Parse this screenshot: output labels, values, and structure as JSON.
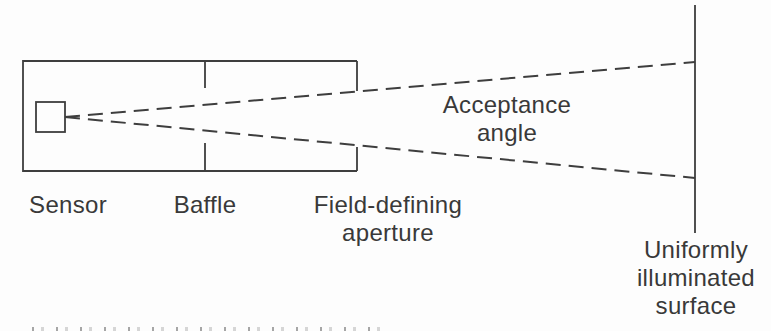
{
  "figure": {
    "background": "#fdfdfd",
    "line_color": "#3e3e3e",
    "text_color": "#393939",
    "labels": {
      "sensor": "Sensor",
      "baffle": "Baffle",
      "aperture": [
        "Field-defining",
        "aperture"
      ],
      "acceptance": [
        "Acceptance",
        "angle"
      ],
      "surface": [
        "Uniformly",
        "illuminated",
        "surface"
      ]
    }
  }
}
